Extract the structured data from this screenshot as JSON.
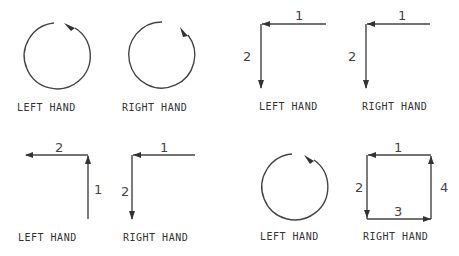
{
  "figures": [
    {
      "id": "fig-top-left-circle",
      "type": "circle",
      "hand_label": "LEFT HAND",
      "direction": "counterclockwise",
      "numbers": []
    },
    {
      "id": "fig-top-right-circle",
      "type": "circle",
      "hand_label": "RIGHT HAND",
      "direction": "clockwise",
      "numbers": []
    },
    {
      "id": "fig-top-left-corner",
      "type": "corner",
      "hand_label": "LEFT HAND",
      "numbers": [
        "1",
        "2"
      ]
    },
    {
      "id": "fig-top-right-corner",
      "type": "corner",
      "hand_label": "RIGHT HAND",
      "numbers": [
        "1",
        "2"
      ]
    },
    {
      "id": "fig-bottom-left-corner",
      "type": "corner",
      "hand_label": "LEFT HAND",
      "numbers": [
        "2",
        "1"
      ]
    },
    {
      "id": "fig-bottom-mid-corner",
      "type": "corner",
      "hand_label": "RIGHT HAND",
      "numbers": [
        "1",
        "2"
      ]
    },
    {
      "id": "fig-bottom-right-circle",
      "type": "circle",
      "hand_label": "LEFT HAND",
      "direction": "counterclockwise",
      "numbers": []
    },
    {
      "id": "fig-bottom-right-square",
      "type": "square",
      "hand_label": "RIGHT HAND",
      "numbers": [
        "1",
        "2",
        "3",
        "4"
      ]
    }
  ],
  "colors": {
    "stroke": "#444444",
    "text": "#333333",
    "background": "#ffffff"
  }
}
